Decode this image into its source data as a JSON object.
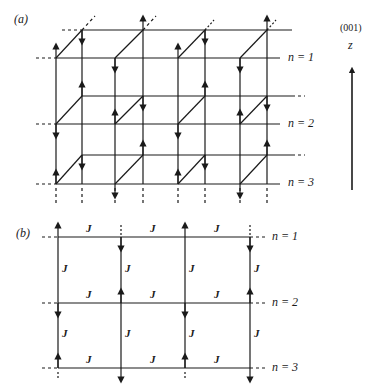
{
  "panel_a": {
    "label": "(a)",
    "layer_labels": [
      "n = 1",
      "n = 2",
      "n = 3"
    ],
    "axis": {
      "direction": "(001)",
      "name": "z"
    }
  },
  "panel_b": {
    "label": "(b)",
    "layer_labels": [
      "n = 1",
      "n = 2",
      "n = 3"
    ],
    "coupling": "J"
  },
  "colors": {
    "ink": "#1a1a1a",
    "background": "#ffffff"
  }
}
